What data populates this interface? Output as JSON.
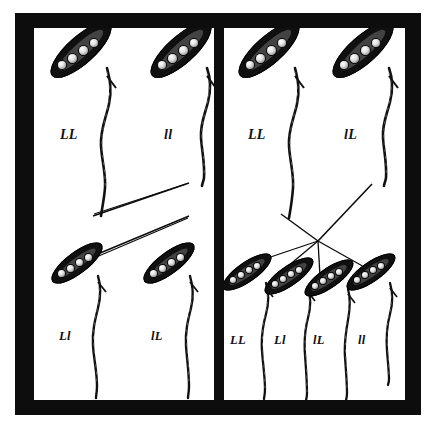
{
  "figure": {
    "kind": "genetics-cross-diagram",
    "colors": {
      "frame": "#0d0d0d",
      "panel_background": "#ffffff",
      "pod": "#101010",
      "pea": "#e2e2e2",
      "ink": "#111111"
    }
  },
  "panels": [
    {
      "id": "left",
      "name": "monohybrid-cross",
      "parents": [
        {
          "genotype": "LL",
          "pod_size": "large"
        },
        {
          "genotype": "ll",
          "pod_size": "large"
        }
      ],
      "offspring": [
        {
          "genotype": "Ll",
          "pod_size": "small"
        },
        {
          "genotype": "lL",
          "pod_size": "small"
        }
      ],
      "cross_pattern": "x-cross"
    },
    {
      "id": "right",
      "name": "heterozygous-cross",
      "parents": [
        {
          "genotype": "LL",
          "pod_size": "large"
        },
        {
          "genotype": "lL",
          "pod_size": "large"
        }
      ],
      "offspring": [
        {
          "genotype": "LL",
          "pod_size": "small"
        },
        {
          "genotype": "Ll",
          "pod_size": "small"
        },
        {
          "genotype": "lL",
          "pod_size": "small"
        },
        {
          "genotype": "ll",
          "pod_size": "small"
        }
      ],
      "cross_pattern": "converging-fan"
    }
  ]
}
